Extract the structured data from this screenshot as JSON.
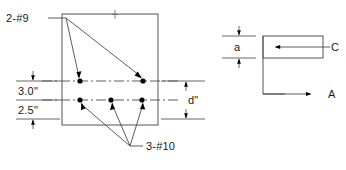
{
  "figure": {
    "labels": {
      "top_bars": "2-#9",
      "bottom_bars": "3-#10",
      "dim_upper": "3.0\"",
      "dim_lower": "2.5\"",
      "dim_depth": "d\"",
      "dim_block": "a",
      "force_compression": "C",
      "force_axial": "A"
    },
    "colors": {
      "line": "#555555",
      "text": "#1a1a1a",
      "bar_fill": "#000000",
      "background": "#ffffff"
    },
    "section": {
      "rect": {
        "x": 62,
        "y": 14,
        "width": 96,
        "height": 111
      },
      "top_bar_row_y": 81,
      "bottom_bar_row_y": 100,
      "top_bars_x": [
        80,
        143
      ],
      "bottom_bars_x": [
        80,
        111,
        142
      ],
      "bar_radius": 2.6,
      "top_tick_x": 115
    },
    "stress_block": {
      "rect": {
        "x": 263,
        "y": 36,
        "width": 60,
        "height": 22
      },
      "vertical_x": 263,
      "base_y": 94,
      "axial_arrow_end": 310
    }
  }
}
